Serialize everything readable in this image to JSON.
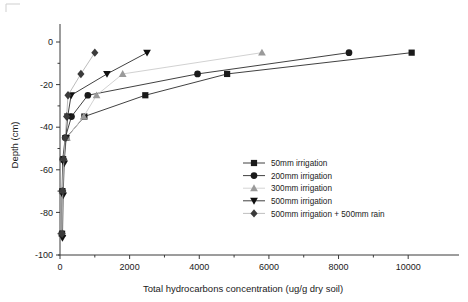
{
  "chart_data": {
    "type": "line",
    "title": "",
    "xlabel": "Total hydrocarbons concentration (ug/g dry soil)",
    "ylabel": "Depth (cm)",
    "xlim": [
      0,
      11000
    ],
    "ylim": [
      -100,
      5
    ],
    "xticks": [
      0,
      2000,
      4000,
      6000,
      8000,
      10000
    ],
    "xtick_labels": [
      "0",
      "2000",
      "4000",
      "6000",
      "8000",
      "10000"
    ],
    "yticks": [
      0,
      -20,
      -40,
      -60,
      -80,
      -100
    ],
    "ytick_labels": [
      "0",
      "-20",
      "-40",
      "-60",
      "-80",
      "-100"
    ],
    "grid": false,
    "legend_position": "center-right",
    "orientation": "x = concentration, y = depth (negative downward)",
    "series": [
      {
        "name": "50mm irrigation",
        "marker": "square",
        "color": "#1a1a1a",
        "line_color": "#2b2b2b",
        "points": [
          {
            "x": 10100,
            "y": -5
          },
          {
            "x": 4800,
            "y": -15
          },
          {
            "x": 2450,
            "y": -25
          },
          {
            "x": 700,
            "y": -35
          },
          {
            "x": 180,
            "y": -45
          },
          {
            "x": 90,
            "y": -55
          },
          {
            "x": 70,
            "y": -70
          },
          {
            "x": 60,
            "y": -90
          }
        ]
      },
      {
        "name": "200mm irrigation",
        "marker": "circle",
        "color": "#1a1a1a",
        "line_color": "#2b2b2b",
        "points": [
          {
            "x": 8300,
            "y": -5
          },
          {
            "x": 3950,
            "y": -15
          },
          {
            "x": 800,
            "y": -25
          },
          {
            "x": 330,
            "y": -35
          },
          {
            "x": 150,
            "y": -45
          },
          {
            "x": 80,
            "y": -55
          },
          {
            "x": 60,
            "y": -70
          },
          {
            "x": 50,
            "y": -90
          }
        ]
      },
      {
        "name": "300mm irrigation",
        "marker": "triangle-up",
        "color": "#9a9a9a",
        "line_color": "#cccccc",
        "points": [
          {
            "x": 5800,
            "y": -5
          },
          {
            "x": 1800,
            "y": -15
          },
          {
            "x": 1050,
            "y": -25
          },
          {
            "x": 680,
            "y": -35
          },
          {
            "x": 200,
            "y": -45
          },
          {
            "x": 100,
            "y": -55
          },
          {
            "x": 70,
            "y": -70
          },
          {
            "x": 55,
            "y": -90
          }
        ]
      },
      {
        "name": "500mm irrigation",
        "marker": "triangle-down",
        "color": "#101010",
        "line_color": "#2b2b2b",
        "points": [
          {
            "x": 2500,
            "y": -5
          },
          {
            "x": 1350,
            "y": -15
          },
          {
            "x": 320,
            "y": -25
          },
          {
            "x": 220,
            "y": -35
          },
          {
            "x": 170,
            "y": -45
          },
          {
            "x": 120,
            "y": -57
          },
          {
            "x": 90,
            "y": -72
          },
          {
            "x": 70,
            "y": -92
          }
        ]
      },
      {
        "name": "500mm irrigation + 500mm rain",
        "marker": "diamond",
        "color": "#3b3b3b",
        "line_color": "#b4b4b4",
        "points": [
          {
            "x": 1000,
            "y": -5
          },
          {
            "x": 600,
            "y": -15
          },
          {
            "x": 230,
            "y": -25
          },
          {
            "x": 190,
            "y": -35
          },
          {
            "x": 150,
            "y": -45
          },
          {
            "x": 110,
            "y": -55
          },
          {
            "x": 80,
            "y": -70
          },
          {
            "x": 60,
            "y": -90
          }
        ]
      }
    ]
  },
  "legend": {
    "entries": [
      {
        "label": "50mm irrigation",
        "marker": "square",
        "color": "#1a1a1a",
        "line_color": "#2b2b2b"
      },
      {
        "label": "200mm irrigation",
        "marker": "circle",
        "color": "#1a1a1a",
        "line_color": "#2b2b2b"
      },
      {
        "label": "300mm irrigation",
        "marker": "triangle-up",
        "color": "#9a9a9a",
        "line_color": "#cfcfcf"
      },
      {
        "label": "500mm irrigation",
        "marker": "triangle-down",
        "color": "#101010",
        "line_color": "#2b2b2b"
      },
      {
        "label": "500mm irrigation + 500mm rain",
        "marker": "diamond",
        "color": "#3b3b3b",
        "line_color": "#b8b8b8"
      }
    ]
  }
}
